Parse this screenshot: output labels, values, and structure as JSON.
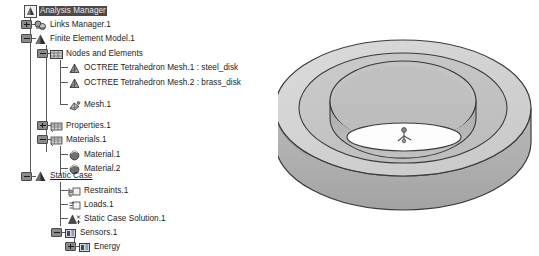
{
  "window": {
    "app_name": "Analysis Manager",
    "background_color": "#ffffff"
  },
  "spec_tree": {
    "name": "specification-tree",
    "selected_node": "Analysis Manager",
    "active_node": "Static Case",
    "nodes": [
      {
        "label": "Analysis Manager",
        "icon": "analysis-manager-icon",
        "depth": 0,
        "state": "selected",
        "expander": "none"
      },
      {
        "label": "Links Manager.1",
        "icon": "links-manager-icon",
        "depth": 1,
        "state": "normal",
        "expander": "plus"
      },
      {
        "label": "Finite Element Model.1",
        "icon": "finite-element-model-icon",
        "depth": 1,
        "state": "normal",
        "expander": "minus"
      },
      {
        "label": "Nodes and Elements",
        "icon": "nodes-elements-icon",
        "depth": 2,
        "state": "normal",
        "expander": "minus"
      },
      {
        "label": "OCTREE Tetrahedron Mesh.1 : steel_disk",
        "icon": "octree-mesh-icon",
        "depth": 3,
        "state": "normal",
        "expander": "none"
      },
      {
        "label": "OCTREE Tetrahedron Mesh.2 : brass_disk",
        "icon": "octree-mesh-icon",
        "depth": 3,
        "state": "normal",
        "expander": "none"
      },
      {
        "label": "Mesh.1",
        "icon": "mesh-icon",
        "depth": 3,
        "state": "normal",
        "expander": "none"
      },
      {
        "label": "Properties.1",
        "icon": "properties-icon",
        "depth": 2,
        "state": "normal",
        "expander": "plus"
      },
      {
        "label": "Materials.1",
        "icon": "materials-icon",
        "depth": 2,
        "state": "normal",
        "expander": "minus"
      },
      {
        "label": "Material.1",
        "icon": "material-sphere-icon",
        "depth": 3,
        "state": "normal",
        "expander": "none"
      },
      {
        "label": "Material.2",
        "icon": "material-sphere-icon",
        "depth": 3,
        "state": "normal",
        "expander": "none"
      },
      {
        "label": "Static Case",
        "icon": "static-case-icon",
        "depth": 1,
        "state": "active",
        "expander": "minus"
      },
      {
        "label": "Restraints.1",
        "icon": "restraints-icon",
        "depth": 2,
        "state": "normal",
        "expander": "none"
      },
      {
        "label": "Loads.1",
        "icon": "loads-icon",
        "depth": 2,
        "state": "normal",
        "expander": "none"
      },
      {
        "label": "Static Case Solution.1",
        "icon": "static-case-solution-icon",
        "depth": 2,
        "state": "normal",
        "expander": "none"
      },
      {
        "label": "Sensors.1",
        "icon": "sensors-icon",
        "depth": 2,
        "state": "normal",
        "expander": "minus"
      },
      {
        "label": "Energy",
        "icon": "energy-sensor-icon",
        "depth": 3,
        "state": "normal",
        "expander": "plus"
      }
    ]
  },
  "viewport": {
    "name": "3d-viewport",
    "model_description": "annular disk assembly",
    "colors": {
      "outer_ring_top": "#d2d2d2",
      "inner_ring_top": "#bebebe",
      "side_wall": "#b2b2b2",
      "outline": "#3a3a3a",
      "hole_floor": "#fdfdfd"
    },
    "compass_marker": "axis-system-marker"
  }
}
